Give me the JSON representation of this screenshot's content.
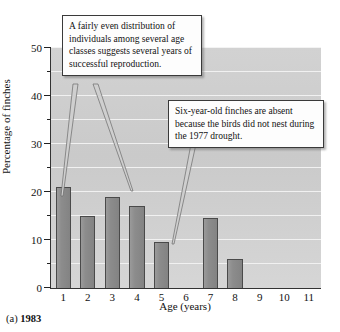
{
  "figure": {
    "caption_prefix": "(a)",
    "caption_year": "1983"
  },
  "callouts": [
    {
      "id": "even-distribution-callout",
      "text": "A fairly even distribution of individuals among several age classes suggests several years of successful reproduction."
    },
    {
      "id": "absent-six-year-olds-callout",
      "text": "Six-year-old finches are absent because the birds did not nest during the 1977 drought."
    }
  ],
  "colors": {
    "bar_fill": "#8c8c8c",
    "bar_edge": "#4a4a4a",
    "plot_background": "#d0d0d0",
    "gridline": "#f2f2f2",
    "axis": "#222222",
    "callout_background": "#fdfdfd",
    "callout_border": "#3a3a3a"
  },
  "chart_data": {
    "type": "bar",
    "title": "",
    "xlabel": "Age (years)",
    "ylabel": "Percentage of finches",
    "categories": [
      "1",
      "2",
      "3",
      "4",
      "5",
      "6",
      "7",
      "8",
      "9",
      "10",
      "11"
    ],
    "values": [
      21,
      15,
      19,
      17,
      9.5,
      0,
      14.5,
      6,
      0,
      0,
      0
    ],
    "ylim": [
      0,
      50
    ],
    "xlim": [
      0,
      11
    ],
    "ytick_major": [
      0,
      10,
      20,
      30,
      40,
      50
    ],
    "ytick_minor": [
      5,
      15,
      25,
      35,
      45
    ],
    "ytick_labels": [
      "0",
      "10",
      "20",
      "30",
      "40",
      "50"
    ],
    "grid": true,
    "grid_axis": "y",
    "legend": "none",
    "annotations": [
      {
        "text": "A fairly even distribution of individuals among several age classes suggests several years of successful reproduction.",
        "points_to": [
          "1",
          "4"
        ]
      },
      {
        "text": "Six-year-old finches are absent because the birds did not nest during the 1977 drought.",
        "points_to": [
          "6"
        ]
      }
    ]
  }
}
